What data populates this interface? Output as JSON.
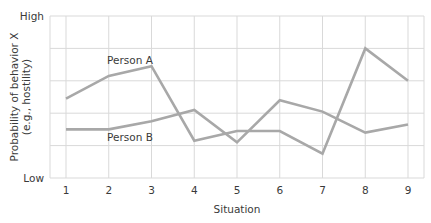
{
  "chart_data": {
    "type": "line",
    "title": "",
    "xlabel": "Situation",
    "ylabel": "Probability of behavior X",
    "ylabel_sub": "(e.g., hostility)",
    "x": [
      1,
      2,
      3,
      4,
      5,
      6,
      7,
      8,
      9
    ],
    "categories": [
      "1",
      "2",
      "3",
      "4",
      "5",
      "6",
      "7",
      "8",
      "9"
    ],
    "y_tick_labels": {
      "high": "High",
      "low": "Low"
    },
    "ylim": [
      0,
      1
    ],
    "grid": true,
    "series": [
      {
        "name": "Person A",
        "values": [
          0.49,
          0.63,
          0.69,
          0.23,
          0.29,
          0.29,
          0.15,
          0.8,
          0.6
        ]
      },
      {
        "name": "Person B",
        "values": [
          0.3,
          0.3,
          0.35,
          0.42,
          0.22,
          0.48,
          0.41,
          0.28,
          0.33
        ]
      }
    ],
    "annotations": [
      {
        "text": "Person A",
        "series": "Person A",
        "near_x": 2.5
      },
      {
        "text": "Person B",
        "series": "Person B",
        "near_x": 2.5
      }
    ]
  },
  "colors": {
    "line": "#a8a8a8",
    "grid": "#d9d9d9",
    "text": "#3a3a3a"
  }
}
